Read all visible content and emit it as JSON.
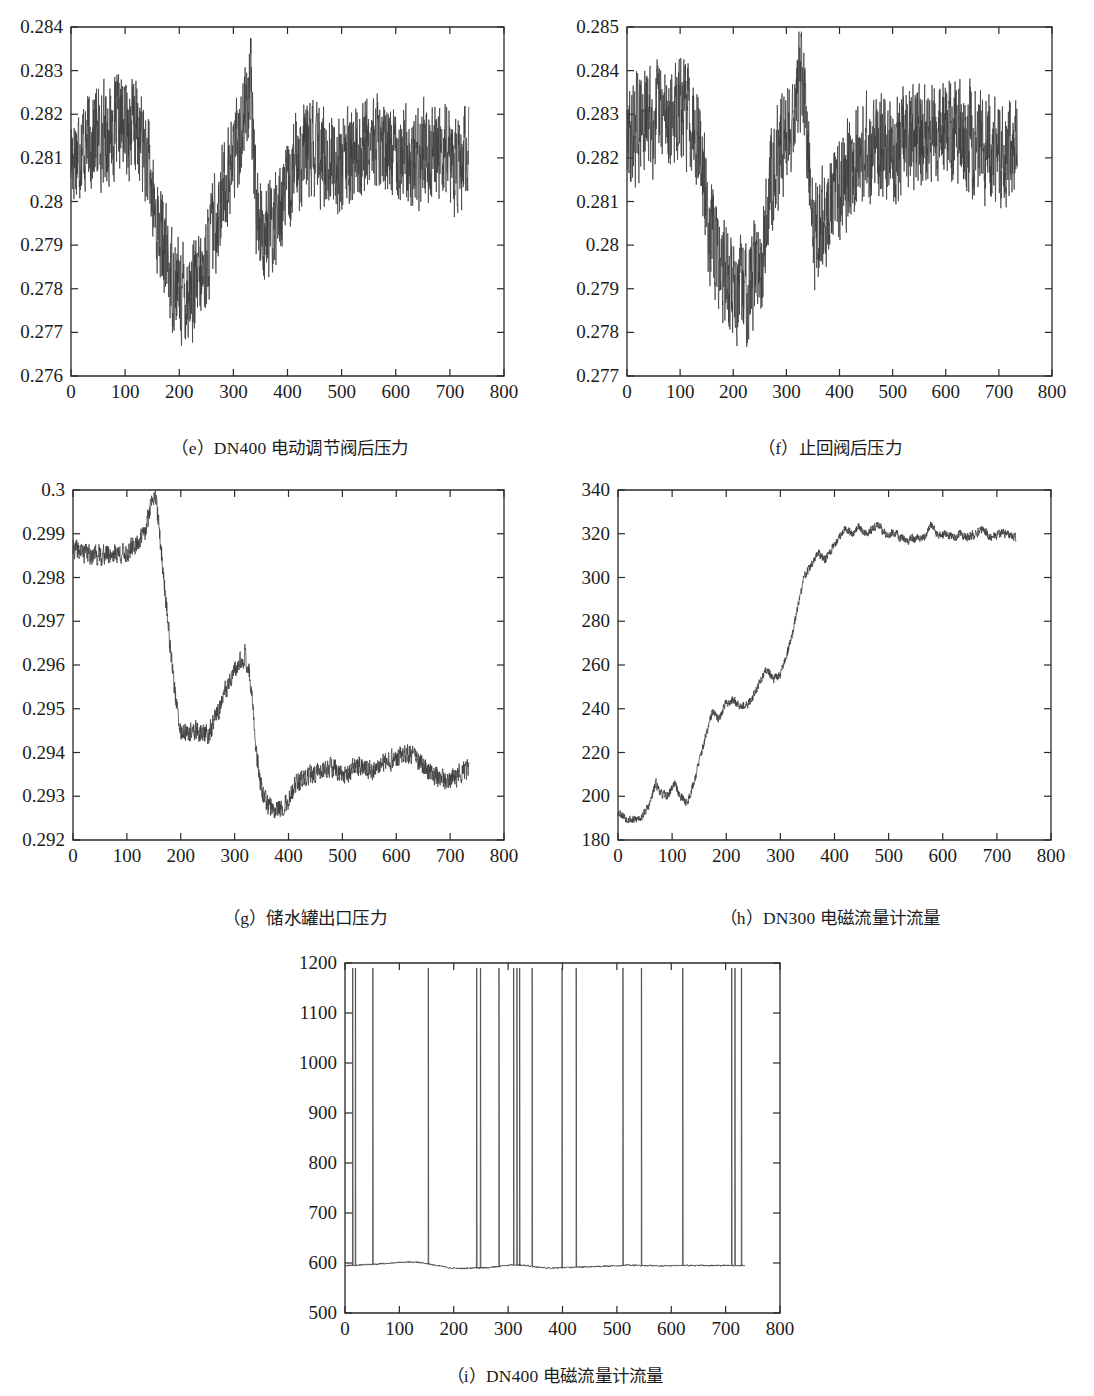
{
  "figure": {
    "panels": [
      {
        "id": "e",
        "caption": "（e）DN400 电动调节阀后压力",
        "caption_label": "（e）",
        "caption_text": "DN400 电动调节阀后压力"
      },
      {
        "id": "f",
        "caption": "（f）止回阀后压力",
        "caption_label": "（f）",
        "caption_text": "止回阀后压力"
      },
      {
        "id": "g",
        "caption": "（g）储水罐出口压力",
        "caption_label": "（g）",
        "caption_text": "储水罐出口压力"
      },
      {
        "id": "h",
        "caption": "（h）DN300 电磁流量计流量",
        "caption_label": "（h）",
        "caption_text": "DN300 电磁流量计流量"
      },
      {
        "id": "i",
        "caption": "（i）DN400 电磁流量计流量",
        "caption_label": "（i）",
        "caption_text": "DN400 电磁流量计流量"
      }
    ],
    "line_color": "#3c3c3c",
    "axis_color": "#2a2a2a",
    "background": "#ffffff"
  },
  "chart_data": [
    {
      "id": "e",
      "type": "line",
      "title": "（e）DN400 电动调节阀后压力",
      "xlabel": "",
      "ylabel": "",
      "xlim": [
        0,
        800
      ],
      "ylim": [
        0.276,
        0.284
      ],
      "xticks": [
        0,
        100,
        200,
        300,
        400,
        500,
        600,
        700,
        800
      ],
      "yticks": [
        0.276,
        0.277,
        0.278,
        0.279,
        0.28,
        0.281,
        0.282,
        0.283,
        0.284
      ],
      "xtick_labels": [
        "0",
        "100",
        "200",
        "300",
        "400",
        "500",
        "600",
        "700",
        "800"
      ],
      "ytick_labels": [
        "0.276",
        "0.277",
        "0.278",
        "0.279",
        "0.28",
        "0.281",
        "0.282",
        "0.283",
        "0.284"
      ],
      "grid": false,
      "legend": null,
      "data_end_x": 735,
      "noise_amplitude": 0.0009,
      "seed": 17,
      "baseline": [
        {
          "x": 0,
          "y": 0.2811
        },
        {
          "x": 20,
          "y": 0.2813
        },
        {
          "x": 45,
          "y": 0.2815
        },
        {
          "x": 70,
          "y": 0.2816
        },
        {
          "x": 95,
          "y": 0.2818
        },
        {
          "x": 120,
          "y": 0.2817
        },
        {
          "x": 140,
          "y": 0.281
        },
        {
          "x": 155,
          "y": 0.2797
        },
        {
          "x": 170,
          "y": 0.279
        },
        {
          "x": 185,
          "y": 0.2783
        },
        {
          "x": 200,
          "y": 0.278
        },
        {
          "x": 215,
          "y": 0.2779
        },
        {
          "x": 230,
          "y": 0.278
        },
        {
          "x": 245,
          "y": 0.2783
        },
        {
          "x": 260,
          "y": 0.2792
        },
        {
          "x": 275,
          "y": 0.28
        },
        {
          "x": 290,
          "y": 0.2806
        },
        {
          "x": 305,
          "y": 0.2812
        },
        {
          "x": 320,
          "y": 0.282
        },
        {
          "x": 332,
          "y": 0.2826
        },
        {
          "x": 342,
          "y": 0.28
        },
        {
          "x": 352,
          "y": 0.2794
        },
        {
          "x": 365,
          "y": 0.2792
        },
        {
          "x": 378,
          "y": 0.2796
        },
        {
          "x": 392,
          "y": 0.2801
        },
        {
          "x": 405,
          "y": 0.2803
        },
        {
          "x": 418,
          "y": 0.281
        },
        {
          "x": 440,
          "y": 0.2812
        },
        {
          "x": 470,
          "y": 0.281
        },
        {
          "x": 500,
          "y": 0.2809
        },
        {
          "x": 530,
          "y": 0.2811
        },
        {
          "x": 555,
          "y": 0.2814
        },
        {
          "x": 580,
          "y": 0.2812
        },
        {
          "x": 605,
          "y": 0.2813
        },
        {
          "x": 630,
          "y": 0.2809
        },
        {
          "x": 660,
          "y": 0.2812
        },
        {
          "x": 690,
          "y": 0.2811
        },
        {
          "x": 710,
          "y": 0.2808
        },
        {
          "x": 735,
          "y": 0.281
        }
      ]
    },
    {
      "id": "f",
      "type": "line",
      "title": "（f）止回阀后压力",
      "xlabel": "",
      "ylabel": "",
      "xlim": [
        0,
        800
      ],
      "ylim": [
        0.277,
        0.285
      ],
      "xticks": [
        0,
        100,
        200,
        300,
        400,
        500,
        600,
        700,
        800
      ],
      "yticks": [
        0.277,
        0.278,
        0.279,
        0.28,
        0.281,
        0.282,
        0.283,
        0.284,
        0.285
      ],
      "xtick_labels": [
        "0",
        "100",
        "200",
        "300",
        "400",
        "500",
        "600",
        "700",
        "800"
      ],
      "ytick_labels": [
        "0.277",
        "0.278",
        "0.279",
        "0.28",
        "0.281",
        "0.282",
        "0.283",
        "0.284",
        "0.285"
      ],
      "grid": false,
      "legend": null,
      "data_end_x": 735,
      "noise_amplitude": 0.00095,
      "seed": 29,
      "baseline": [
        {
          "x": 0,
          "y": 0.2823
        },
        {
          "x": 18,
          "y": 0.2827
        },
        {
          "x": 40,
          "y": 0.2829
        },
        {
          "x": 65,
          "y": 0.283
        },
        {
          "x": 90,
          "y": 0.283
        },
        {
          "x": 115,
          "y": 0.2831
        },
        {
          "x": 135,
          "y": 0.2826
        },
        {
          "x": 148,
          "y": 0.281
        },
        {
          "x": 162,
          "y": 0.28
        },
        {
          "x": 178,
          "y": 0.2795
        },
        {
          "x": 195,
          "y": 0.2791
        },
        {
          "x": 212,
          "y": 0.2789
        },
        {
          "x": 228,
          "y": 0.2791
        },
        {
          "x": 245,
          "y": 0.2795
        },
        {
          "x": 258,
          "y": 0.28
        },
        {
          "x": 272,
          "y": 0.2817
        },
        {
          "x": 288,
          "y": 0.2821
        },
        {
          "x": 302,
          "y": 0.2827
        },
        {
          "x": 316,
          "y": 0.2831
        },
        {
          "x": 330,
          "y": 0.284
        },
        {
          "x": 340,
          "y": 0.282
        },
        {
          "x": 352,
          "y": 0.2803
        },
        {
          "x": 366,
          "y": 0.2805
        },
        {
          "x": 382,
          "y": 0.2808
        },
        {
          "x": 398,
          "y": 0.2814
        },
        {
          "x": 415,
          "y": 0.2818
        },
        {
          "x": 432,
          "y": 0.2821
        },
        {
          "x": 455,
          "y": 0.2822
        },
        {
          "x": 485,
          "y": 0.2822
        },
        {
          "x": 515,
          "y": 0.2823
        },
        {
          "x": 545,
          "y": 0.2824
        },
        {
          "x": 575,
          "y": 0.2826
        },
        {
          "x": 600,
          "y": 0.2826
        },
        {
          "x": 625,
          "y": 0.2825
        },
        {
          "x": 655,
          "y": 0.2824
        },
        {
          "x": 680,
          "y": 0.2822
        },
        {
          "x": 700,
          "y": 0.2819
        },
        {
          "x": 720,
          "y": 0.2823
        },
        {
          "x": 735,
          "y": 0.2822
        }
      ]
    },
    {
      "id": "g",
      "type": "line",
      "title": "（g）储水罐出口压力",
      "xlabel": "",
      "ylabel": "",
      "xlim": [
        0,
        800
      ],
      "ylim": [
        0.292,
        0.3
      ],
      "xticks": [
        0,
        100,
        200,
        300,
        400,
        500,
        600,
        700,
        800
      ],
      "yticks": [
        0.292,
        0.293,
        0.294,
        0.295,
        0.296,
        0.297,
        0.298,
        0.299,
        0.3
      ],
      "xtick_labels": [
        "0",
        "100",
        "200",
        "300",
        "400",
        "500",
        "600",
        "700",
        "800"
      ],
      "ytick_labels": [
        "0.292",
        "0.293",
        "0.294",
        "0.295",
        "0.296",
        "0.297",
        "0.298",
        "0.299",
        "0.3"
      ],
      "grid": false,
      "legend": null,
      "data_end_x": 735,
      "noise_amplitude": 0.00018,
      "seed": 41,
      "baseline": [
        {
          "x": 0,
          "y": 0.29865
        },
        {
          "x": 25,
          "y": 0.29855
        },
        {
          "x": 50,
          "y": 0.2985
        },
        {
          "x": 75,
          "y": 0.29855
        },
        {
          "x": 100,
          "y": 0.29855
        },
        {
          "x": 120,
          "y": 0.2988
        },
        {
          "x": 135,
          "y": 0.29905
        },
        {
          "x": 145,
          "y": 0.29975
        },
        {
          "x": 152,
          "y": 0.3
        },
        {
          "x": 160,
          "y": 0.2991
        },
        {
          "x": 170,
          "y": 0.2978
        },
        {
          "x": 180,
          "y": 0.2965
        },
        {
          "x": 190,
          "y": 0.2953
        },
        {
          "x": 198,
          "y": 0.2945
        },
        {
          "x": 210,
          "y": 0.2944
        },
        {
          "x": 225,
          "y": 0.2945
        },
        {
          "x": 240,
          "y": 0.29445
        },
        {
          "x": 252,
          "y": 0.2944
        },
        {
          "x": 265,
          "y": 0.2948
        },
        {
          "x": 280,
          "y": 0.2953
        },
        {
          "x": 295,
          "y": 0.2957
        },
        {
          "x": 310,
          "y": 0.29605
        },
        {
          "x": 320,
          "y": 0.29625
        },
        {
          "x": 330,
          "y": 0.2956
        },
        {
          "x": 340,
          "y": 0.294
        },
        {
          "x": 352,
          "y": 0.293
        },
        {
          "x": 365,
          "y": 0.29275
        },
        {
          "x": 382,
          "y": 0.29272
        },
        {
          "x": 398,
          "y": 0.29285
        },
        {
          "x": 412,
          "y": 0.29325
        },
        {
          "x": 430,
          "y": 0.2934
        },
        {
          "x": 455,
          "y": 0.29355
        },
        {
          "x": 480,
          "y": 0.29365
        },
        {
          "x": 505,
          "y": 0.2935
        },
        {
          "x": 530,
          "y": 0.2937
        },
        {
          "x": 555,
          "y": 0.2936
        },
        {
          "x": 580,
          "y": 0.29375
        },
        {
          "x": 605,
          "y": 0.2939
        },
        {
          "x": 620,
          "y": 0.294
        },
        {
          "x": 645,
          "y": 0.29375
        },
        {
          "x": 670,
          "y": 0.2935
        },
        {
          "x": 690,
          "y": 0.29335
        },
        {
          "x": 710,
          "y": 0.29345
        },
        {
          "x": 735,
          "y": 0.29365
        }
      ]
    },
    {
      "id": "h",
      "type": "line",
      "title": "（h）DN300 电磁流量计流量",
      "xlabel": "",
      "ylabel": "",
      "xlim": [
        0,
        800
      ],
      "ylim": [
        180,
        340
      ],
      "xticks": [
        0,
        100,
        200,
        300,
        400,
        500,
        600,
        700,
        800
      ],
      "yticks": [
        180,
        200,
        220,
        240,
        260,
        280,
        300,
        320,
        340
      ],
      "xtick_labels": [
        "0",
        "100",
        "200",
        "300",
        "400",
        "500",
        "600",
        "700",
        "800"
      ],
      "ytick_labels": [
        "180",
        "200",
        "220",
        "240",
        "260",
        "280",
        "300",
        "320",
        "340"
      ],
      "grid": false,
      "legend": null,
      "data_end_x": 735,
      "noise_amplitude": 1.6,
      "seed": 53,
      "baseline": [
        {
          "x": 0,
          "y": 193
        },
        {
          "x": 15,
          "y": 190
        },
        {
          "x": 30,
          "y": 189
        },
        {
          "x": 45,
          "y": 191
        },
        {
          "x": 58,
          "y": 196
        },
        {
          "x": 70,
          "y": 206
        },
        {
          "x": 80,
          "y": 201
        },
        {
          "x": 92,
          "y": 200
        },
        {
          "x": 104,
          "y": 206
        },
        {
          "x": 115,
          "y": 200
        },
        {
          "x": 128,
          "y": 197
        },
        {
          "x": 140,
          "y": 206
        },
        {
          "x": 152,
          "y": 218
        },
        {
          "x": 163,
          "y": 228
        },
        {
          "x": 175,
          "y": 239
        },
        {
          "x": 185,
          "y": 235
        },
        {
          "x": 198,
          "y": 242
        },
        {
          "x": 212,
          "y": 244
        },
        {
          "x": 225,
          "y": 242
        },
        {
          "x": 238,
          "y": 241
        },
        {
          "x": 250,
          "y": 246
        },
        {
          "x": 262,
          "y": 252
        },
        {
          "x": 275,
          "y": 258
        },
        {
          "x": 288,
          "y": 254
        },
        {
          "x": 298,
          "y": 255
        },
        {
          "x": 310,
          "y": 263
        },
        {
          "x": 322,
          "y": 274
        },
        {
          "x": 335,
          "y": 290
        },
        {
          "x": 345,
          "y": 301
        },
        {
          "x": 358,
          "y": 306
        },
        {
          "x": 370,
          "y": 311
        },
        {
          "x": 382,
          "y": 308
        },
        {
          "x": 395,
          "y": 313
        },
        {
          "x": 408,
          "y": 318
        },
        {
          "x": 420,
          "y": 323
        },
        {
          "x": 432,
          "y": 320
        },
        {
          "x": 445,
          "y": 323
        },
        {
          "x": 458,
          "y": 320
        },
        {
          "x": 470,
          "y": 322
        },
        {
          "x": 482,
          "y": 324
        },
        {
          "x": 495,
          "y": 319
        },
        {
          "x": 508,
          "y": 321
        },
        {
          "x": 522,
          "y": 318
        },
        {
          "x": 535,
          "y": 317
        },
        {
          "x": 548,
          "y": 318
        },
        {
          "x": 562,
          "y": 317
        },
        {
          "x": 578,
          "y": 324
        },
        {
          "x": 592,
          "y": 319
        },
        {
          "x": 605,
          "y": 320
        },
        {
          "x": 618,
          "y": 318
        },
        {
          "x": 632,
          "y": 320
        },
        {
          "x": 645,
          "y": 318
        },
        {
          "x": 660,
          "y": 320
        },
        {
          "x": 675,
          "y": 322
        },
        {
          "x": 690,
          "y": 318
        },
        {
          "x": 705,
          "y": 320
        },
        {
          "x": 720,
          "y": 320
        },
        {
          "x": 735,
          "y": 318
        }
      ]
    },
    {
      "id": "i",
      "type": "line",
      "title": "（i）DN400 电磁流量计流量",
      "xlabel": "",
      "ylabel": "",
      "xlim": [
        0,
        800
      ],
      "ylim": [
        500,
        1200
      ],
      "xticks": [
        0,
        100,
        200,
        300,
        400,
        500,
        600,
        700,
        800
      ],
      "yticks": [
        500,
        600,
        700,
        800,
        900,
        1000,
        1100,
        1200
      ],
      "xtick_labels": [
        "0",
        "100",
        "200",
        "300",
        "400",
        "500",
        "600",
        "700",
        "800"
      ],
      "ytick_labels": [
        "500",
        "600",
        "700",
        "800",
        "900",
        "1000",
        "1100",
        "1200"
      ],
      "grid": false,
      "legend": null,
      "data_end_x": 735,
      "noise_amplitude": 1.2,
      "seed": 67,
      "spike_value": 1190,
      "spike_positions": [
        14,
        19,
        51,
        153,
        242,
        249,
        283,
        310,
        316,
        321,
        344,
        399,
        425,
        511,
        545,
        621,
        711,
        717,
        729
      ],
      "baseline": [
        {
          "x": 0,
          "y": 595
        },
        {
          "x": 25,
          "y": 596
        },
        {
          "x": 50,
          "y": 597
        },
        {
          "x": 75,
          "y": 599
        },
        {
          "x": 100,
          "y": 601
        },
        {
          "x": 120,
          "y": 602
        },
        {
          "x": 140,
          "y": 601
        },
        {
          "x": 155,
          "y": 598
        },
        {
          "x": 175,
          "y": 594
        },
        {
          "x": 195,
          "y": 590
        },
        {
          "x": 215,
          "y": 589
        },
        {
          "x": 240,
          "y": 590
        },
        {
          "x": 265,
          "y": 591
        },
        {
          "x": 290,
          "y": 594
        },
        {
          "x": 310,
          "y": 596
        },
        {
          "x": 330,
          "y": 595
        },
        {
          "x": 355,
          "y": 592
        },
        {
          "x": 380,
          "y": 590
        },
        {
          "x": 405,
          "y": 591
        },
        {
          "x": 430,
          "y": 592
        },
        {
          "x": 460,
          "y": 593
        },
        {
          "x": 490,
          "y": 594
        },
        {
          "x": 520,
          "y": 596
        },
        {
          "x": 550,
          "y": 595
        },
        {
          "x": 580,
          "y": 594
        },
        {
          "x": 610,
          "y": 595
        },
        {
          "x": 640,
          "y": 595
        },
        {
          "x": 670,
          "y": 595
        },
        {
          "x": 700,
          "y": 595
        },
        {
          "x": 735,
          "y": 595
        }
      ]
    }
  ]
}
